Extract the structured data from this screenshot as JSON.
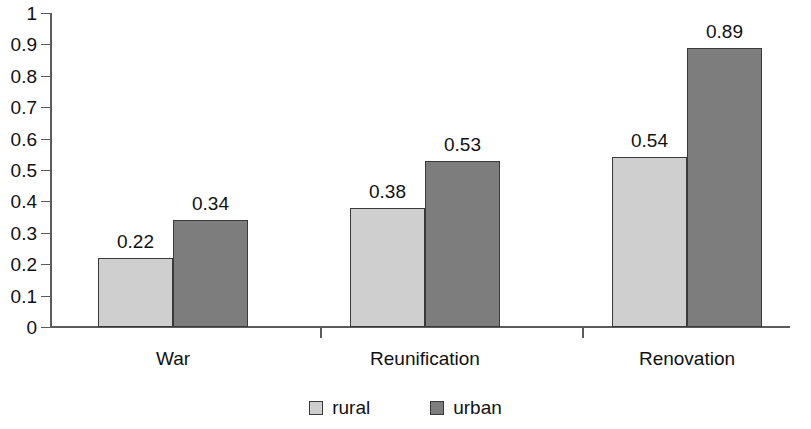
{
  "chart_data": {
    "type": "bar",
    "title": "",
    "subtitle": "",
    "xlabel": "",
    "ylabel": "",
    "ylim": [
      0,
      1
    ],
    "ytick_labels": [
      "1",
      "0.9",
      "0.8",
      "0.7",
      "0.6",
      "0.5",
      "0.4",
      "0.3",
      "0.2",
      "0.1",
      "0"
    ],
    "ytick_values": [
      1,
      0.9,
      0.8,
      0.7,
      0.6,
      0.5,
      0.4,
      0.3,
      0.2,
      0.1,
      0
    ],
    "grid": false,
    "legend_position": "bottom-center",
    "categories": [
      "War",
      "Reunification",
      "Renovation"
    ],
    "series": [
      {
        "name": "rural",
        "color": "#cfcfcf",
        "values": [
          0.22,
          0.38,
          0.54
        ],
        "labels": [
          "0.22",
          "0.38",
          "0.54"
        ]
      },
      {
        "name": "urban",
        "color": "#7d7d7d",
        "values": [
          0.34,
          0.53,
          0.89
        ],
        "labels": [
          "0.34",
          "0.53",
          "0.89"
        ]
      }
    ],
    "legend": [
      {
        "label": "rural",
        "color": "#cfcfcf"
      },
      {
        "label": "urban",
        "color": "#7d7d7d"
      }
    ],
    "axis_color": "#5b5b5b",
    "bar_border_color": "#3a3a3a"
  }
}
